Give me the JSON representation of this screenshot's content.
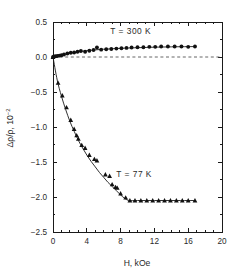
{
  "chart_data": {
    "type": "scatter",
    "title": "",
    "xlabel": "H, kOe",
    "ylabel": "Δρ/ρ, 10",
    "ylabel_exponent": "-2",
    "xlim": [
      0,
      20
    ],
    "ylim": [
      -2.5,
      0.5
    ],
    "grid": false,
    "legend_position": "inline-annotations",
    "xticks": [
      0,
      4,
      8,
      12,
      16,
      20
    ],
    "xticklabels": [
      "0",
      "4",
      "8",
      "12",
      "16",
      "20"
    ],
    "xminor_step": 1,
    "yticks": [
      0.5,
      0.0,
      -0.5,
      -1.0,
      -1.5,
      -2.0,
      -2.5
    ],
    "yticklabels": [
      "0.5",
      "0.0",
      "-0.5",
      "-1.0",
      "-1.5",
      "-2.0",
      "-2.5"
    ],
    "yminor_step": 0.25,
    "reference_lines": [
      {
        "name": "zero-line",
        "orientation": "horizontal",
        "value": 0.0,
        "style": "dashed"
      }
    ],
    "annotations": [
      {
        "name": "annotation-300k",
        "text": "T = 300 K",
        "x": 9.2,
        "y": 0.33
      },
      {
        "name": "annotation-77k",
        "text": "T = 77 K",
        "x": 9.6,
        "y": -1.72
      }
    ],
    "series": [
      {
        "name": "T = 300 K",
        "marker": "circle",
        "color": "#111111",
        "x": [
          0.0,
          0.25,
          0.5,
          0.75,
          1.0,
          1.3,
          1.7,
          2.1,
          2.5,
          2.9,
          3.3,
          3.8,
          4.3,
          4.8,
          5.2,
          5.7,
          6.3,
          6.9,
          7.5,
          8.1,
          8.7,
          9.3,
          10.0,
          10.7,
          11.4,
          12.1,
          12.8,
          13.6,
          14.4,
          15.2,
          16.0,
          16.8
        ],
        "y": [
          0.0,
          0.01,
          0.015,
          0.02,
          0.025,
          0.035,
          0.05,
          0.06,
          0.065,
          0.075,
          0.085,
          0.075,
          0.09,
          0.1,
          0.135,
          0.105,
          0.11,
          0.115,
          0.12,
          0.125,
          0.13,
          0.135,
          0.14,
          0.14,
          0.145,
          0.145,
          0.15,
          0.15,
          0.15,
          0.15,
          0.145,
          0.15
        ]
      },
      {
        "name": "T = 77 K",
        "marker": "triangle",
        "color": "#111111",
        "x": [
          0.0,
          0.6,
          1.1,
          1.6,
          2.1,
          2.5,
          2.8,
          3.0,
          3.4,
          3.8,
          4.3,
          4.9,
          5.2,
          6.2,
          6.7,
          7.0,
          7.4,
          7.6,
          8.0,
          8.6,
          9.1,
          9.7,
          10.4,
          11.1,
          11.8,
          12.5,
          13.2,
          13.9,
          14.6,
          15.3,
          16.0,
          16.8
        ],
        "y": [
          0.0,
          -0.37,
          -0.55,
          -0.72,
          -0.9,
          -1.03,
          -1.12,
          -1.17,
          -1.26,
          -1.3,
          -1.4,
          -1.46,
          -1.48,
          -1.68,
          -1.7,
          -1.82,
          -1.86,
          -1.87,
          -1.95,
          -2.01,
          -2.05,
          -2.05,
          -2.05,
          -2.05,
          -2.05,
          -2.05,
          -2.05,
          -2.05,
          -2.05,
          -2.05,
          -2.05,
          -2.05
        ]
      }
    ],
    "fit_curves": [
      {
        "name": "fit-300k",
        "for_series": "T = 300 K",
        "points_x": [
          0.0,
          1.0,
          2.0,
          3.0,
          4.0,
          5.0,
          6.0,
          7.0,
          8.0,
          10.0,
          12.0,
          14.0,
          16.0,
          16.9
        ],
        "points_y": [
          0.0,
          0.03,
          0.055,
          0.075,
          0.09,
          0.102,
          0.111,
          0.118,
          0.124,
          0.133,
          0.14,
          0.145,
          0.148,
          0.149
        ]
      },
      {
        "name": "fit-77k",
        "for_series": "T = 77 K",
        "points_x": [
          0.0,
          0.5,
          1.0,
          1.5,
          2.0,
          2.5,
          3.0,
          3.5,
          4.0,
          4.5,
          5.0,
          5.5,
          6.0,
          6.5,
          7.0,
          7.5,
          8.0,
          8.5,
          9.0,
          10.0,
          12.0,
          14.0,
          16.0,
          16.9
        ],
        "points_y": [
          0.0,
          -0.33,
          -0.56,
          -0.75,
          -0.92,
          -1.06,
          -1.19,
          -1.3,
          -1.4,
          -1.49,
          -1.57,
          -1.65,
          -1.72,
          -1.79,
          -1.85,
          -1.91,
          -1.97,
          -2.02,
          -2.05,
          -2.05,
          -2.05,
          -2.05,
          -2.05,
          -2.05
        ]
      }
    ]
  }
}
